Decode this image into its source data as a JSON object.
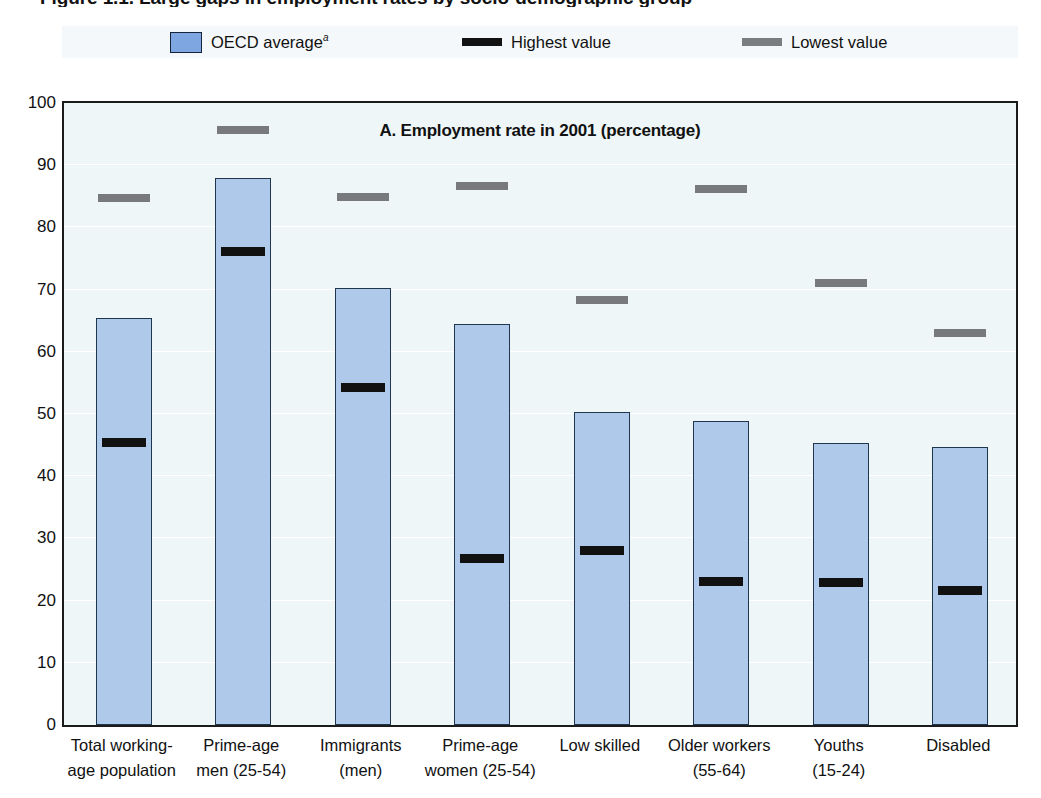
{
  "figure": {
    "title": "Figure 1.1. Large gaps in employment rates by socio-demographic group",
    "panel_title": "A.  Employment rate in 2001 (percentage)"
  },
  "legend": {
    "items": [
      {
        "label": "OECD average",
        "sup": "a",
        "marker": "box-blue",
        "color": "#7ea6e0"
      },
      {
        "label": "Highest value",
        "sup": "",
        "marker": "bar-black",
        "color": "#121212"
      },
      {
        "label": "Lowest value",
        "sup": "",
        "marker": "bar-grey",
        "color": "#7a7d80"
      }
    ]
  },
  "chart_data": {
    "type": "bar",
    "title": "A.  Employment rate in 2001 (percentage)",
    "xlabel": "",
    "ylabel": "",
    "ylim": [
      0,
      100
    ],
    "ytick_labels": [
      "0",
      "10",
      "20",
      "30",
      "40",
      "50",
      "60",
      "70",
      "80",
      "90",
      "100"
    ],
    "yticks": [
      0,
      10,
      20,
      30,
      40,
      50,
      60,
      70,
      80,
      90,
      100
    ],
    "grid": true,
    "legend_position": "top",
    "categories": [
      "Total working-\nage population",
      "Prime-age\nmen (25-54)",
      "Immigrants\n(men)",
      "Prime-age\nwomen (25-54)",
      "Low skilled",
      "Older workers\n(55-64)",
      "Youths\n(15-24)",
      "Disabled"
    ],
    "category_lines": [
      [
        "Total working-",
        "age population"
      ],
      [
        "Prime-age",
        "men (25-54)"
      ],
      [
        "Immigrants",
        "(men)"
      ],
      [
        "Prime-age",
        "women (25-54)"
      ],
      [
        "Low skilled",
        ""
      ],
      [
        "Older workers",
        "(55-64)"
      ],
      [
        "Youths",
        "(15-24)"
      ],
      [
        "Disabled",
        ""
      ]
    ],
    "series": [
      {
        "name": "OECD average",
        "values": [
          65.4,
          87.9,
          70.2,
          64.5,
          50.4,
          48.8,
          45.3,
          44.7
        ]
      },
      {
        "name": "Highest value",
        "values": [
          45.4,
          76.0,
          54.2,
          26.7,
          28.0,
          23.0,
          22.8,
          21.6
        ]
      },
      {
        "name": "Lowest value",
        "values": [
          84.7,
          95.6,
          84.9,
          86.6,
          68.4,
          86.2,
          71.1,
          63.0
        ]
      }
    ]
  }
}
